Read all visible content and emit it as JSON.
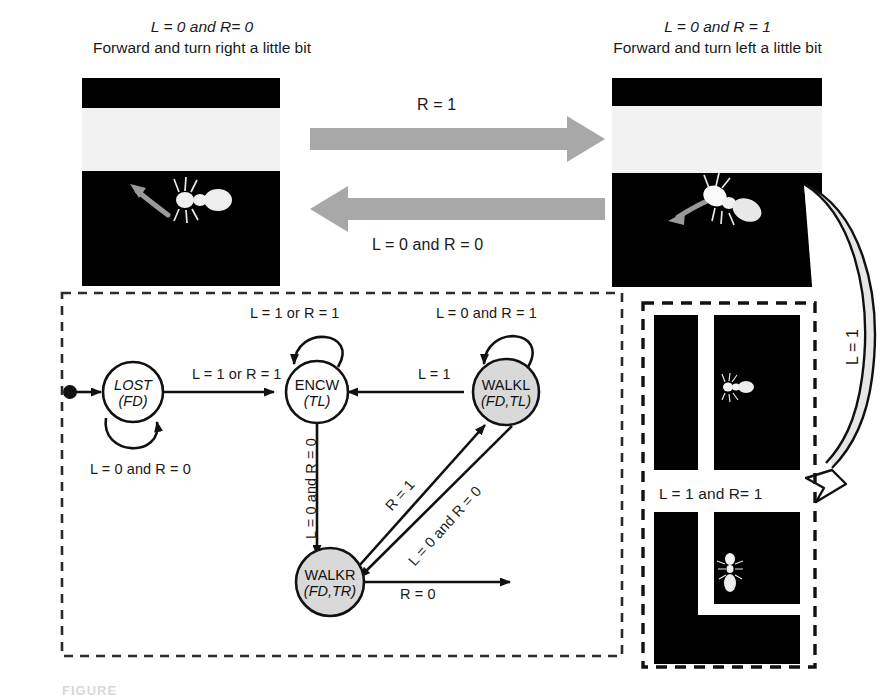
{
  "figure": {
    "caption_partial": "FIGURE",
    "top_left_panel": {
      "condition": "L = 0 and R= 0",
      "description": "Forward and turn right a little bit",
      "image_name": "ant-turning-right-photo"
    },
    "top_right_panel": {
      "condition": "L = 0 and R = 1",
      "description": "Forward and turn left a little bit",
      "image_name": "ant-turning-left-photo"
    },
    "transition_arrows": {
      "rightward_label": "R = 1",
      "leftward_label": "L = 0 and R = 0",
      "curved_label": "L = 1"
    },
    "right_panel": {
      "label": "L = 1 and R= 1",
      "top_image_name": "ant-corridor-photo",
      "bottom_image_name": "ant-corner-photo"
    },
    "state_machine": {
      "states": [
        {
          "id": "LOST",
          "name": "LOST",
          "actions": "(FD)",
          "filled": false
        },
        {
          "id": "ENCW",
          "name": "ENCW",
          "actions": "(TL)",
          "filled": false
        },
        {
          "id": "WALKL",
          "name": "WALKL",
          "actions": "(FD,TL)",
          "filled": true
        },
        {
          "id": "WALKR",
          "name": "WALKR",
          "actions": "(FD,TR)",
          "filled": true
        }
      ],
      "transitions": [
        {
          "from": "start",
          "to": "LOST",
          "label": ""
        },
        {
          "from": "LOST",
          "to": "LOST",
          "label": "L = 0 and R = 0"
        },
        {
          "from": "LOST",
          "to": "ENCW",
          "label": "L = 1 or R = 1"
        },
        {
          "from": "ENCW",
          "to": "ENCW",
          "label": "L = 1 or R = 1"
        },
        {
          "from": "ENCW",
          "to": "WALKR",
          "label": "L = 0 and R = 0"
        },
        {
          "from": "WALKL",
          "to": "ENCW",
          "label": "L = 1"
        },
        {
          "from": "WALKL",
          "to": "WALKL",
          "label": "L = 0 and R = 1"
        },
        {
          "from": "WALKR",
          "to": "WALKL",
          "label": "R = 1"
        },
        {
          "from": "WALKL",
          "to": "WALKR",
          "label": "L = 0 and R = 0"
        },
        {
          "from": "WALKR",
          "to": "out",
          "label": "R = 0"
        }
      ]
    }
  }
}
